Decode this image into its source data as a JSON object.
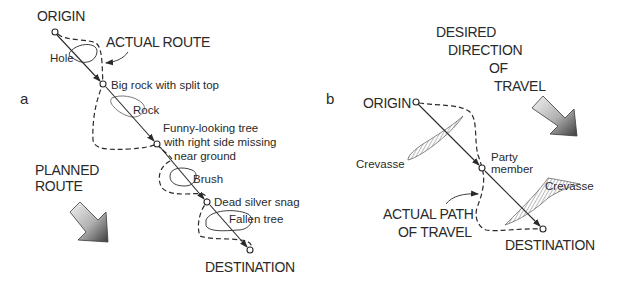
{
  "panels": {
    "a": {
      "letter": "a",
      "origin_label": "ORIGIN",
      "destination_label": "DESTINATION",
      "actual_route_label": "ACTUAL ROUTE",
      "planned_route_label_line1": "PLANNED",
      "planned_route_label_line2": "ROUTE",
      "landmarks": [
        {
          "label": "Big rock with split top"
        },
        {
          "label_line1": "Funny-looking tree",
          "label_line2": "with right side missing",
          "label_line3": "near ground"
        },
        {
          "label": "Dead silver snag"
        }
      ],
      "obstacles": [
        {
          "label": "Hole"
        },
        {
          "label": "Rock"
        },
        {
          "label": "Brush"
        },
        {
          "label": "Fallen tree"
        }
      ]
    },
    "b": {
      "letter": "b",
      "origin_label": "ORIGIN",
      "destination_label": "DESTINATION",
      "desired_direction_line1": "DESIRED",
      "desired_direction_line2": "DIRECTION",
      "desired_direction_line3": "OF",
      "desired_direction_line4": "TRAVEL",
      "party_member_line1": "Party",
      "party_member_line2": "member",
      "actual_path_line1": "ACTUAL PATH",
      "actual_path_line2": "OF TRAVEL",
      "crevasses": [
        {
          "label": "Crevasse"
        },
        {
          "label": "Crevasse"
        }
      ]
    }
  },
  "colors": {
    "ink": "#2a2a2a",
    "arrow_light": "#f2f2f2",
    "arrow_dark": "#4a4a4a"
  }
}
